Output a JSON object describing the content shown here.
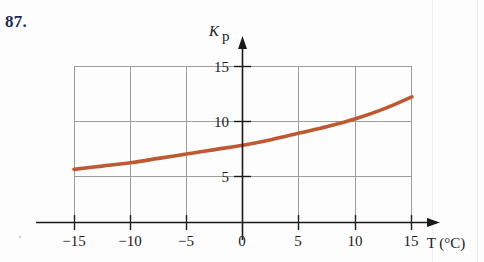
{
  "problem": {
    "number": "87."
  },
  "figure": {
    "name": "equilibrium-constant-vs-temperature-plot",
    "curve_color": "#bd5a33",
    "grid_color": "#9a9a9a",
    "axis_color": "#1a1a1a"
  },
  "chart_data": {
    "type": "line",
    "title": "",
    "xlabel": "T (°C)",
    "ylabel": "Kₚ",
    "ylabel_base": "K",
    "ylabel_sub": "p",
    "xlim": [
      -15,
      15
    ],
    "ylim": [
      0,
      17.5
    ],
    "xticks": [
      -15,
      -10,
      -5,
      0,
      5,
      10,
      15
    ],
    "xticklabels": [
      "−15",
      "−10",
      "−5",
      "0",
      "5",
      "10",
      "15"
    ],
    "yticks": [
      5,
      10,
      15
    ],
    "yticklabels": [
      "5",
      "10",
      "15"
    ],
    "grid": true,
    "grid_x": [
      -15,
      -10,
      -5,
      0,
      5,
      10,
      15
    ],
    "grid_y": [
      5,
      10,
      15
    ],
    "legend": null,
    "series": [
      {
        "name": "Kp(T)",
        "x": [
          -15,
          -12.5,
          -10,
          -7.5,
          -5,
          -2.5,
          0,
          2.5,
          5,
          7.5,
          10,
          12.5,
          15
        ],
        "y": [
          5.6,
          5.9,
          6.2,
          6.6,
          7.0,
          7.4,
          7.8,
          8.3,
          8.9,
          9.5,
          10.2,
          11.1,
          12.2
        ]
      }
    ],
    "annotations": []
  }
}
